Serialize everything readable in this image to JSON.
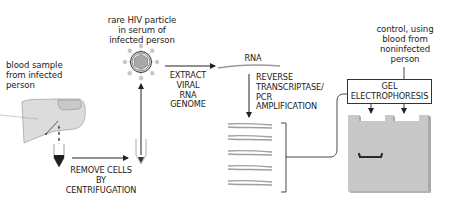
{
  "diagram": {
    "labels": {
      "blood_sample": [
        "blood sample",
        "from infected",
        "person"
      ],
      "hiv_particle": [
        "rare HIV particle",
        "in serum of",
        "infected person"
      ],
      "remove_cells": [
        "REMOVE CELLS",
        "BY",
        "CENTRIFUGATION"
      ],
      "extract_rna": [
        "EXTRACT",
        "VIRAL",
        "RNA",
        "GENOME"
      ],
      "rna": "RNA",
      "rt_pcr": [
        "REVERSE",
        "TRANSCRIPTASE/",
        "PCR",
        "AMPLIFICATION"
      ],
      "control": [
        "control, using",
        "blood from",
        "noninfected",
        "person"
      ],
      "gel": [
        "GEL",
        "ELECTROPHORESIS"
      ]
    },
    "colors": {
      "line": "#222222",
      "skin": "#dcdcdc",
      "gel": "#c8c8c8",
      "gel_side": "#a9a9a9",
      "dna_strand": "#9a9a9a",
      "band": "#2a2a2a",
      "virus_core": "#a8a8a8"
    },
    "steps": [
      {
        "id": 1,
        "name": "blood-sample"
      },
      {
        "id": 2,
        "name": "centrifugation"
      },
      {
        "id": 3,
        "name": "hiv-particle-in-serum"
      },
      {
        "id": 4,
        "name": "extract-rna"
      },
      {
        "id": 5,
        "name": "rt-pcr-amplification"
      },
      {
        "id": 6,
        "name": "gel-electrophoresis"
      }
    ],
    "gel_lanes": [
      {
        "lane": "sample",
        "band": true
      },
      {
        "lane": "control",
        "band": false
      }
    ],
    "amplified_copies": 5
  }
}
